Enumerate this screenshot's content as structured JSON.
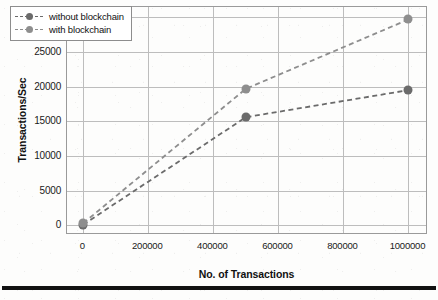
{
  "chart_data": {
    "type": "line",
    "title": "",
    "xlabel": "No. of Transactions",
    "ylabel": "Transactions/Sec",
    "x": [
      0,
      500000,
      1000000
    ],
    "xlim": [
      -50000,
      1060000
    ],
    "ylim": [
      -1400,
      31500
    ],
    "xticks": [
      0,
      200000,
      400000,
      600000,
      800000,
      1000000
    ],
    "xticklabels": [
      "0",
      "200000",
      "400000",
      "600000",
      "800000",
      "1000000"
    ],
    "yticks": [
      0,
      5000,
      10000,
      15000,
      20000,
      25000,
      30000
    ],
    "yticklabels": [
      "0",
      "5000",
      "10000",
      "15000",
      "20000",
      "25000",
      "30000"
    ],
    "grid": true,
    "legend_position": "upper left",
    "series": [
      {
        "name": "without blockchain",
        "values": [
          100,
          15600,
          19500
        ],
        "color": "#6b6b6b",
        "linestyle": "dashed",
        "marker": "circle"
      },
      {
        "name": "with blockchain",
        "values": [
          300,
          19700,
          29700
        ],
        "color": "#8e8e8e",
        "linestyle": "dashed",
        "marker": "circle"
      }
    ]
  },
  "legend": {
    "items": [
      {
        "label": "without blockchain"
      },
      {
        "label": "with blockchain"
      }
    ]
  }
}
